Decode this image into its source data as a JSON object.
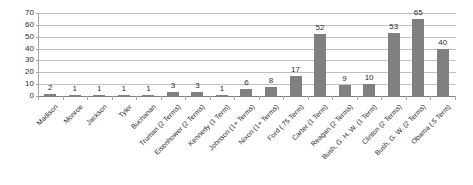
{
  "chart_data": {
    "type": "bar",
    "title": "",
    "xlabel": "",
    "ylabel": "",
    "ylim": [
      0,
      70
    ],
    "yticks": [
      0,
      10,
      20,
      30,
      40,
      50,
      60,
      70
    ],
    "grid": true,
    "legend": "none",
    "bar_color": "#808080",
    "gridline_color": "#bfbfbf",
    "axis_color": "#a6a6a6",
    "categories": [
      "Madison",
      "Monroe",
      "Jackson",
      "Tyler",
      "Buchanan",
      "Truman (2 Terms)",
      "Eisenhower (2 Terms)",
      "Kennedy (1 Term)",
      "Johnson (1+ Terms)",
      "Nixon (1+ Terms)",
      "Ford (.75 Term)",
      "Carter (1 Term)",
      "Reagan (2 Terms)",
      "Bush, G. H. W. (1 Term)",
      "Clinton (2 Terms)",
      "Bush, G. W. (2 Terms)",
      "Obama (.5 Term)"
    ],
    "values": [
      2,
      1,
      1,
      1,
      1,
      3,
      3,
      1,
      6,
      8,
      17,
      52,
      9,
      10,
      53,
      65,
      40
    ],
    "value_labels": [
      "2",
      "1",
      "1",
      "1",
      "1",
      "3",
      "3",
      "1",
      "6",
      "8",
      "17",
      "52",
      "9",
      "10",
      "53",
      "65",
      "40"
    ],
    "ytick_labels": [
      "0",
      "10",
      "20",
      "30",
      "40",
      "50",
      "60",
      "70"
    ]
  }
}
